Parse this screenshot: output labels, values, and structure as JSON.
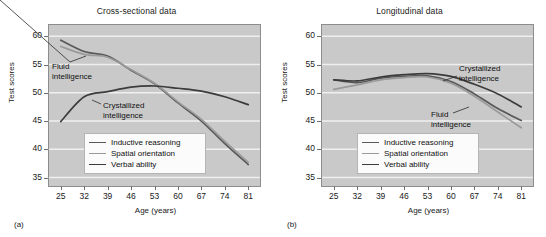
{
  "figure": {
    "panels": [
      {
        "tag": "(a)",
        "title": "Cross-sectional data",
        "xlabel": "Age (years)",
        "ylabel": "Test scores",
        "annotations": [
          {
            "name": "fluid-intelligence",
            "line1": "Fluid",
            "line2": "intelligence"
          },
          {
            "name": "crystallized-intelligence",
            "line1": "Crystallized",
            "line2": "intelligence"
          }
        ]
      },
      {
        "tag": "(b)",
        "title": "Longitudinal data",
        "xlabel": "Age (years)",
        "ylabel": "Test scores",
        "annotations": [
          {
            "name": "crystallized-intelligence",
            "line1": "Crystallized",
            "line2": "intelligence"
          },
          {
            "name": "fluid-intelligence",
            "line1": "Fluid",
            "line2": "intelligence"
          }
        ]
      }
    ],
    "legend": {
      "items": [
        {
          "label": "Inductive reasoning",
          "color": "#585858"
        },
        {
          "label": "Spatial orientation",
          "color": "#9a9a9a"
        },
        {
          "label": "Verbal ability",
          "color": "#3c3c3c"
        }
      ]
    },
    "colors": {
      "plot_background": "#c9c9c9",
      "gridline": "#efefef",
      "axis": "#8d8d8d",
      "text": "#1a1a1a",
      "legend_background": "#fbfbfb"
    }
  },
  "chart_data": [
    {
      "type": "line",
      "title": "Cross-sectional data",
      "panel": "(a)",
      "xlabel": "Age (years)",
      "ylabel": "Test scores",
      "x": [
        25,
        32,
        39,
        46,
        53,
        60,
        67,
        74,
        81
      ],
      "xticks": [
        "25",
        "32",
        "39",
        "46",
        "53",
        "60",
        "67",
        "74",
        "81"
      ],
      "yticks": [
        "35",
        "40",
        "45",
        "50",
        "55",
        "60"
      ],
      "xlim": [
        21.5,
        84.5
      ],
      "ylim": [
        33.5,
        62.0
      ],
      "grid": true,
      "legend_position": "lower center inside",
      "series": [
        {
          "name": "Inductive reasoning",
          "color": "#585858",
          "values": [
            59.3,
            57.3,
            56.5,
            54.0,
            51.6,
            48.2,
            45.0,
            41.0,
            37.3
          ]
        },
        {
          "name": "Spatial orientation",
          "color": "#9a9a9a",
          "values": [
            58.2,
            56.8,
            56.3,
            54.1,
            51.7,
            48.4,
            45.3,
            41.4,
            37.7
          ]
        },
        {
          "name": "Verbal ability",
          "color": "#3c3c3c",
          "values": [
            44.9,
            49.3,
            50.2,
            51.0,
            51.2,
            50.8,
            50.3,
            49.3,
            47.9
          ]
        }
      ],
      "annotations": [
        {
          "text": "Fluid intelligence",
          "points_to": [
            "Inductive reasoning",
            "Spatial orientation"
          ]
        },
        {
          "text": "Crystallized intelligence",
          "points_to": [
            "Verbal ability"
          ]
        }
      ]
    },
    {
      "type": "line",
      "title": "Longitudinal data",
      "panel": "(b)",
      "xlabel": "Age (years)",
      "ylabel": "Test scores",
      "x": [
        25,
        32,
        39,
        46,
        53,
        60,
        67,
        74,
        81
      ],
      "xticks": [
        "25",
        "32",
        "39",
        "46",
        "53",
        "60",
        "67",
        "74",
        "81"
      ],
      "yticks": [
        "35",
        "40",
        "45",
        "50",
        "55",
        "60"
      ],
      "xlim": [
        21.5,
        84.5
      ],
      "ylim": [
        33.5,
        62.0
      ],
      "grid": true,
      "legend_position": "lower center inside",
      "series": [
        {
          "name": "Inductive reasoning",
          "color": "#585858",
          "values": [
            52.3,
            51.8,
            52.6,
            52.9,
            53.0,
            52.0,
            49.8,
            47.2,
            45.1
          ]
        },
        {
          "name": "Spatial orientation",
          "color": "#9a9a9a",
          "values": [
            50.6,
            51.4,
            52.3,
            52.7,
            52.8,
            51.7,
            49.4,
            46.6,
            43.8
          ]
        },
        {
          "name": "Verbal ability",
          "color": "#3c3c3c",
          "values": [
            52.3,
            52.1,
            52.8,
            53.2,
            53.4,
            52.9,
            51.5,
            49.8,
            47.5
          ]
        }
      ],
      "annotations": [
        {
          "text": "Crystallized intelligence",
          "points_to": [
            "Verbal ability"
          ]
        },
        {
          "text": "Fluid intelligence",
          "points_to": [
            "Inductive reasoning",
            "Spatial orientation"
          ]
        }
      ]
    }
  ]
}
